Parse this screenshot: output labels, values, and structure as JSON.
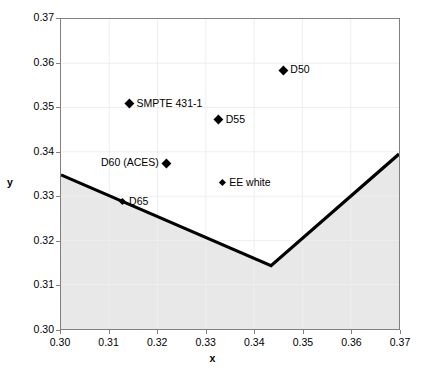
{
  "chart_data": {
    "type": "scatter",
    "title": "",
    "xlabel": "x",
    "ylabel": "y",
    "xlim": [
      0.3,
      0.37
    ],
    "ylim": [
      0.3,
      0.37
    ],
    "xticks": [
      "0.30",
      "0.31",
      "0.32",
      "0.33",
      "0.34",
      "0.35",
      "0.36",
      "0.37"
    ],
    "yticks": [
      "0.30",
      "0.31",
      "0.32",
      "0.33",
      "0.34",
      "0.35",
      "0.36",
      "0.37"
    ],
    "xtick_values": [
      0.3,
      0.31,
      0.32,
      0.33,
      0.34,
      0.35,
      0.36,
      0.37
    ],
    "ytick_values": [
      0.3,
      0.31,
      0.32,
      0.33,
      0.34,
      0.35,
      0.36,
      0.37
    ],
    "grid": true,
    "legend": "none",
    "points": [
      {
        "label": "D50",
        "x": 0.3457,
        "y": 0.3585,
        "marker": "diamond",
        "label_side": "right"
      },
      {
        "label": "SMPTE 431-1",
        "x": 0.314,
        "y": 0.351,
        "marker": "diamond",
        "label_side": "right"
      },
      {
        "label": "D55",
        "x": 0.3324,
        "y": 0.3474,
        "marker": "diamond",
        "label_side": "right"
      },
      {
        "label": "D60 (ACES)",
        "x": 0.3217,
        "y": 0.3377,
        "marker": "diamond",
        "label_side": "left"
      },
      {
        "label": "EE white",
        "x": 0.3333,
        "y": 0.3333,
        "marker": "diamond-small",
        "label_side": "right"
      },
      {
        "label": "D65",
        "x": 0.3127,
        "y": 0.329,
        "marker": "diamond-small",
        "label_side": "right"
      }
    ],
    "boundary_curve": {
      "name": "planckian-locus-boundary",
      "description": "Thick black boundary line; region below it is shaded grey",
      "vertices": [
        {
          "x": 0.3,
          "y": 0.3348
        },
        {
          "x": 0.3435,
          "y": 0.3143
        },
        {
          "x": 0.37,
          "y": 0.3395
        }
      ],
      "line_color": "#000000",
      "fill_color": "#e8e8e8"
    },
    "colors": {
      "marker": "#000000",
      "axis": "#808080",
      "grid": "#eeeeee",
      "shaded_region": "#e8e8e8",
      "text": "#000000"
    }
  }
}
